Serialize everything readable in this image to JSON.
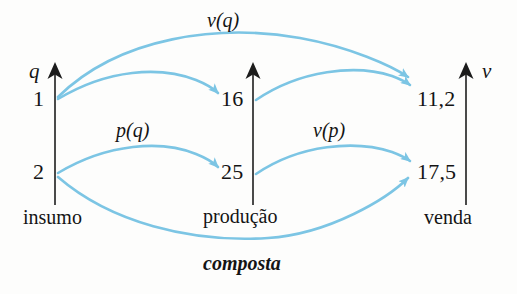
{
  "figure": {
    "caption": "composta",
    "colors": {
      "arrow": "#7cc5e4",
      "axis": "#3a3a3a",
      "text": "#141414",
      "background": "#fdfdfc"
    }
  },
  "axes": [
    {
      "id": "insumo",
      "variable": "q",
      "caption": "insumo",
      "values": [
        "1",
        "2"
      ]
    },
    {
      "id": "producao",
      "variable": "",
      "caption": "produção",
      "values": [
        "16",
        "25"
      ]
    },
    {
      "id": "venda",
      "variable": "v",
      "caption": "venda",
      "values": [
        "11,2",
        "17,5"
      ]
    }
  ],
  "mappings": [
    {
      "label": "v(q)",
      "from": "1",
      "to": "11,2"
    },
    {
      "label": "p(q)",
      "from": "1",
      "to": "16"
    },
    {
      "label": "p(q)",
      "from": "2",
      "to": "25"
    },
    {
      "label": "v(p)",
      "from": "16",
      "to": "11,2"
    },
    {
      "label": "v(p)",
      "from": "25",
      "to": "17,5"
    },
    {
      "label": "composta",
      "from": "2",
      "to": "17,5"
    }
  ],
  "arc_labels": {
    "top": "v(q)",
    "left_mid": "p(q)",
    "right_mid": "v(p)",
    "bottom": "composta"
  }
}
